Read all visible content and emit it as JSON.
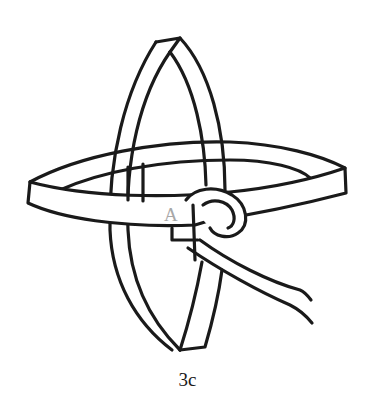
{
  "figure": {
    "caption": "3c",
    "marker_label": "A",
    "colors": {
      "line": "#1a1a1a",
      "marker": "#a8a8a8",
      "background": "#ffffff"
    }
  }
}
